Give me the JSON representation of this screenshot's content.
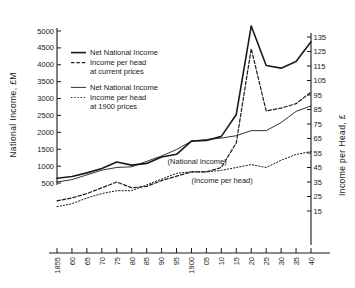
{
  "chart_data": {
    "type": "line",
    "title": "",
    "xlabel": "",
    "ylabel": "National Income, £M",
    "y2label": "Income per Head, £",
    "grid": false,
    "legend_position": "upper-left-inside",
    "xlim": [
      1855,
      1940
    ],
    "ylim": [
      0,
      5250
    ],
    "y2lim": [
      10,
      140
    ],
    "x_tick_labels": [
      "1855",
      "60",
      "65",
      "70",
      "75",
      "80",
      "85",
      "90",
      "95",
      "1900",
      "05",
      "10",
      "15",
      "20",
      "25",
      "30",
      "35",
      "40"
    ],
    "x_tick_values": [
      1855,
      1860,
      1865,
      1870,
      1875,
      1880,
      1885,
      1890,
      1895,
      1900,
      1905,
      1910,
      1915,
      1920,
      1925,
      1930,
      1935,
      1940
    ],
    "y_tick_labels": [
      "500",
      "1000",
      "1500",
      "2000",
      "2500",
      "3000",
      "3500",
      "4000",
      "4500",
      "5000"
    ],
    "y_tick_values": [
      500,
      1000,
      1500,
      2000,
      2500,
      3000,
      3500,
      4000,
      4500,
      5000
    ],
    "y2_tick_labels": [
      "15",
      "25",
      "35",
      "45",
      "55",
      "65",
      "75",
      "85",
      "95",
      "105",
      "115",
      "125",
      "135"
    ],
    "y2_tick_values": [
      15,
      25,
      35,
      45,
      55,
      65,
      75,
      85,
      95,
      105,
      115,
      125,
      135
    ],
    "annotations": [
      {
        "text": "(National Income)",
        "x": 1892,
        "y_axis": "left",
        "y": 1060
      },
      {
        "text": "(Income per head)",
        "x": 1900,
        "y_axis": "right",
        "y": 34
      }
    ],
    "series": [
      {
        "name": "Net National Income at current prices",
        "style": "solid",
        "axis": "left",
        "x": [
          1855,
          1860,
          1865,
          1870,
          1875,
          1880,
          1885,
          1890,
          1895,
          1900,
          1905,
          1910,
          1915,
          1920,
          1925,
          1930,
          1935,
          1940
        ],
        "values": [
          640,
          690,
          800,
          930,
          1120,
          1030,
          1080,
          1270,
          1350,
          1740,
          1760,
          1880,
          2530,
          5150,
          3980,
          3900,
          4100,
          4680
        ]
      },
      {
        "name": "Net National Income at 1900 prices",
        "style": "solid-thin",
        "axis": "left",
        "x": [
          1855,
          1860,
          1865,
          1870,
          1875,
          1880,
          1885,
          1890,
          1895,
          1900,
          1905,
          1910,
          1915,
          1920,
          1925,
          1930,
          1935,
          1940
        ],
        "values": [
          530,
          600,
          740,
          880,
          960,
          980,
          1140,
          1300,
          1490,
          1740,
          1790,
          1830,
          1900,
          2050,
          2050,
          2290,
          2620,
          2780
        ]
      },
      {
        "name": "Income per head at current prices",
        "style": "dashed",
        "axis": "right",
        "x": [
          1855,
          1860,
          1865,
          1870,
          1875,
          1880,
          1885,
          1890,
          1895,
          1900,
          1905,
          1910,
          1915,
          1920,
          1925,
          1930,
          1935,
          1940
        ],
        "values": [
          22,
          24,
          27,
          31,
          35,
          31,
          32,
          36,
          39,
          42,
          42,
          45,
          62,
          127,
          84,
          86,
          89,
          97
        ]
      },
      {
        "name": "Income per head at 1900 prices",
        "style": "dotted",
        "axis": "right",
        "x": [
          1855,
          1860,
          1865,
          1870,
          1875,
          1880,
          1885,
          1890,
          1895,
          1900,
          1905,
          1910,
          1915,
          1920,
          1925,
          1930,
          1935,
          1940
        ],
        "values": [
          18,
          20,
          24,
          27,
          29,
          29,
          33,
          37,
          41,
          42,
          42,
          43,
          45,
          47,
          45,
          50,
          54,
          56
        ]
      }
    ]
  },
  "axes": {
    "left_title": "National Income, £M",
    "right_title": "Income per Head, £"
  },
  "legend": {
    "entries": [
      {
        "swatch": "solid",
        "lines": [
          "Net National Income"
        ]
      },
      {
        "swatch": "dashed",
        "lines": [
          "Income per head",
          "at current prices"
        ]
      },
      {
        "swatch": "solid-thin",
        "lines": [
          "Net National Income"
        ]
      },
      {
        "swatch": "dotted",
        "lines": [
          "Income per head",
          "at 1900 prices"
        ]
      }
    ]
  },
  "colors": {
    "ink": "#1a1a1a",
    "background": "#ffffff"
  }
}
